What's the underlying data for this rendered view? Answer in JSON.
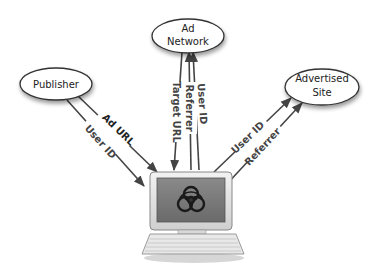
{
  "diagram": {
    "nodes": {
      "publisher": {
        "label": "Publisher"
      },
      "ad_network": {
        "line1": "Ad",
        "line2": "Network"
      },
      "advertised_site": {
        "line1": "Advertised",
        "line2": "Site"
      },
      "computer": {
        "label": "Infected computer",
        "icon": "biohazard-icon"
      }
    },
    "edges": {
      "ad_url": {
        "label": "Ad URL",
        "from": "publisher",
        "to": "computer"
      },
      "user_id_publisher": {
        "label": "User ID",
        "from": "computer",
        "to": "publisher"
      },
      "target_url": {
        "label": "Target URL",
        "from": "ad_network",
        "to": "computer"
      },
      "referrer_network": {
        "label": "Referrer",
        "from": "computer",
        "to": "ad_network"
      },
      "user_id_network": {
        "label": "User ID",
        "from": "computer",
        "to": "ad_network"
      },
      "user_id_site": {
        "label": "User ID",
        "from": "computer",
        "to": "advertised_site"
      },
      "referrer_site": {
        "label": "Referrer",
        "from": "computer",
        "to": "advertised_site"
      }
    }
  }
}
